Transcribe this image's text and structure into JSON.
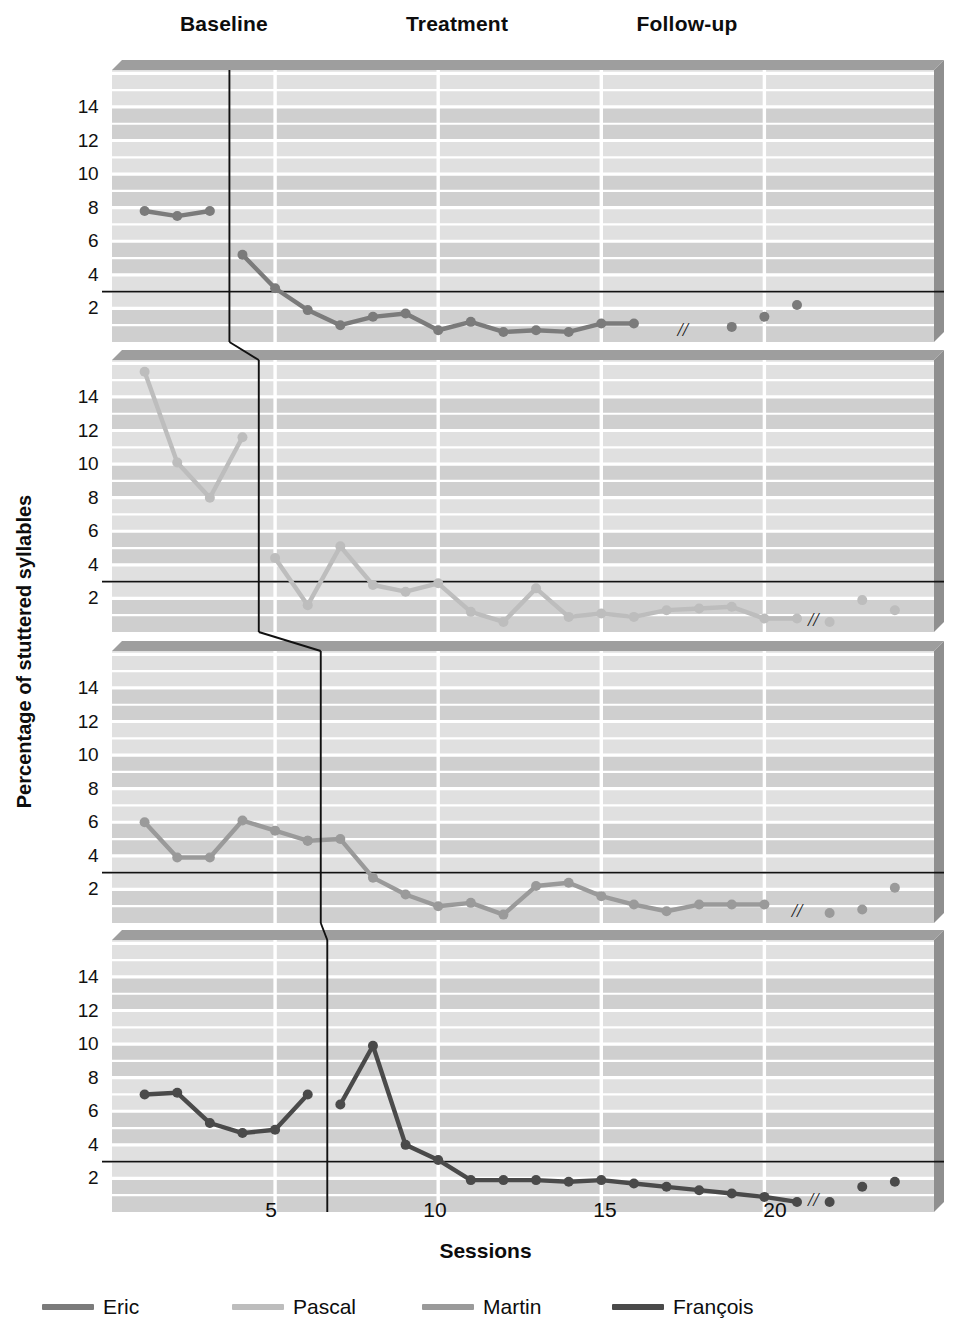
{
  "figure": {
    "ylabel": "Percentage of stuttered syllables",
    "xlabel": "Sessions",
    "phases": [
      {
        "label": "Baseline",
        "x": 224
      },
      {
        "label": "Treatment",
        "x": 457
      },
      {
        "label": "Follow-up",
        "x": 687
      }
    ],
    "xticks": [
      {
        "label": "5",
        "x": 271
      },
      {
        "label": "10",
        "x": 435
      },
      {
        "label": "15",
        "x": 605
      },
      {
        "label": "20",
        "x": 775
      }
    ],
    "yticks": [
      "14",
      "12",
      "10",
      "8",
      "6",
      "4",
      "2"
    ],
    "break_marker": "//",
    "criterion_line_value": 3
  },
  "colors": {
    "eric": "#7b7b7b",
    "pascal": "#bdbdbd",
    "martin": "#9a9a9a",
    "francois": "#4a4a4a",
    "plot_band_light": "#e0e0e0",
    "plot_band_dark": "#cfcfcf",
    "gridline": "#ffffff",
    "panel_top_shade": "#9e9e9e",
    "panel_right_shade": "#8f8f8f",
    "criterion_line": "#111111",
    "phase_line": "#111111"
  },
  "legend": [
    {
      "name": "Eric",
      "color_key": "eric"
    },
    {
      "name": "Pascal",
      "color_key": "pascal"
    },
    {
      "name": "Martin",
      "color_key": "martin"
    },
    {
      "name": "François",
      "color_key": "francois"
    }
  ],
  "chart_data": {
    "type": "line",
    "title": "",
    "subtitle": "",
    "xlabel": "Sessions",
    "ylabel": "Percentage of stuttered syllables",
    "xlim": [
      0,
      25
    ],
    "ylim": [
      0,
      16
    ],
    "xticks": [
      5,
      10,
      15,
      20
    ],
    "yticks": [
      2,
      4,
      6,
      8,
      10,
      12,
      14
    ],
    "grid": true,
    "legend_position": "bottom",
    "annotations": [
      {
        "text": "Baseline",
        "type": "phase-header"
      },
      {
        "text": "Treatment",
        "type": "phase-header"
      },
      {
        "text": "Follow-up",
        "type": "phase-header"
      },
      {
        "text": "//",
        "type": "axis-break",
        "note": "break between treatment and follow-up in each panel"
      },
      {
        "text": "criterion line at 3% stuttered syllables",
        "type": "hline",
        "y": 3
      }
    ],
    "panels": [
      {
        "name": "Eric",
        "color": "#7b7b7b",
        "phase_change_session": 3.6,
        "baseline": {
          "x": [
            1,
            2,
            3
          ],
          "y": [
            7.8,
            7.5,
            7.8
          ]
        },
        "treatment": {
          "x": [
            4,
            5,
            6,
            7,
            8,
            9,
            10,
            11,
            12,
            13,
            14,
            15,
            16
          ],
          "y": [
            5.2,
            3.2,
            1.9,
            1.0,
            1.5,
            1.7,
            0.7,
            1.2,
            0.6,
            0.7,
            0.6,
            1.1,
            1.1
          ]
        },
        "followup": {
          "x": [
            19,
            20,
            21
          ],
          "y": [
            0.9,
            1.5,
            2.2
          ]
        }
      },
      {
        "name": "Pascal",
        "color": "#bdbdbd",
        "phase_change_session": 4.5,
        "baseline": {
          "x": [
            1,
            2,
            3,
            4
          ],
          "y": [
            15.5,
            10.1,
            8.0,
            11.6
          ]
        },
        "treatment": {
          "x": [
            5,
            6,
            7,
            8,
            9,
            10,
            11,
            12,
            13,
            14,
            15,
            16,
            17,
            18,
            19,
            20,
            21
          ],
          "y": [
            4.4,
            1.6,
            5.1,
            2.8,
            2.4,
            2.9,
            1.2,
            0.6,
            2.6,
            0.9,
            1.1,
            0.9,
            1.3,
            1.4,
            1.5,
            0.8,
            0.8
          ]
        },
        "followup": {
          "x": [
            22,
            23,
            24
          ],
          "y": [
            0.6,
            1.9,
            1.3
          ]
        }
      },
      {
        "name": "Martin",
        "color": "#9a9a9a",
        "phase_change_session": 6.4,
        "baseline": {
          "x": [
            1,
            2,
            3,
            4,
            5,
            6
          ],
          "y": [
            6.0,
            3.9,
            3.9,
            6.1,
            5.5,
            4.9
          ]
        },
        "treatment": {
          "x": [
            6,
            7,
            8,
            9,
            10,
            11,
            12,
            13,
            14,
            15,
            16,
            17,
            18,
            19,
            20
          ],
          "y": [
            4.9,
            5.0,
            2.7,
            1.7,
            1.0,
            1.2,
            0.5,
            2.2,
            2.4,
            1.6,
            1.1,
            0.7,
            1.1,
            1.1,
            1.1
          ]
        },
        "followup": {
          "x": [
            22,
            23,
            24
          ],
          "y": [
            0.6,
            0.8,
            2.1
          ]
        }
      },
      {
        "name": "François",
        "color": "#4a4a4a",
        "phase_change_session": 6.6,
        "baseline": {
          "x": [
            1,
            2,
            3,
            4,
            5,
            6
          ],
          "y": [
            7.0,
            7.1,
            5.3,
            4.7,
            4.9,
            7.0
          ]
        },
        "treatment": {
          "x": [
            7,
            8,
            9,
            10,
            11,
            12,
            13,
            14,
            15,
            16,
            17,
            18,
            19,
            20,
            21
          ],
          "y": [
            6.4,
            9.9,
            4.0,
            3.1,
            1.9,
            1.9,
            1.9,
            1.8,
            1.9,
            1.7,
            1.5,
            1.3,
            1.1,
            0.9,
            0.6
          ]
        },
        "followup": {
          "x": [
            22,
            23,
            24
          ],
          "y": [
            0.6,
            1.5,
            1.8
          ]
        }
      }
    ]
  }
}
